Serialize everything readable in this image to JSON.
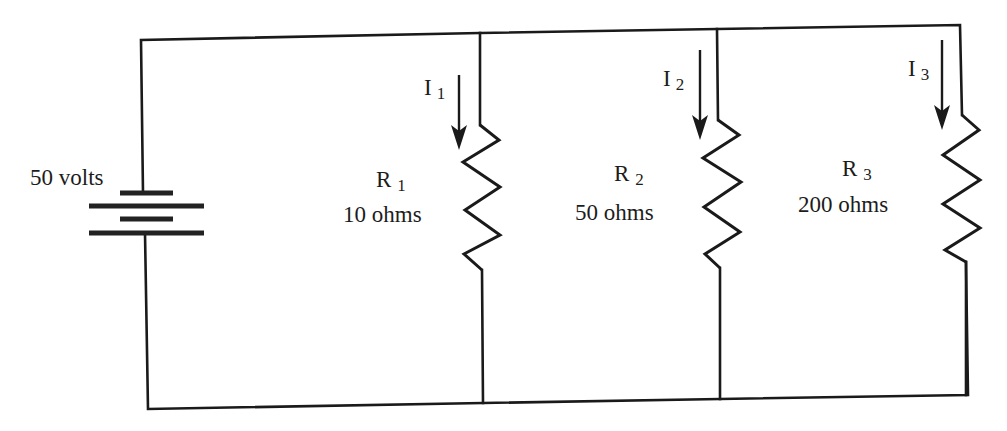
{
  "diagram": {
    "type": "parallel-circuit-schematic",
    "colors": {
      "background": "#ffffff",
      "ink": "#1a1a1a"
    },
    "source": {
      "label": "50 volts",
      "symbol": "battery-icon",
      "voltage_value": 50,
      "voltage_unit": "volts"
    },
    "branches": [
      {
        "resistor_name": "R",
        "resistor_index": "1",
        "resistance_label": "10 ohms",
        "resistance_value": 10,
        "current_name": "I",
        "current_index": "1"
      },
      {
        "resistor_name": "R",
        "resistor_index": "2",
        "resistance_label": "50 ohms",
        "resistance_value": 50,
        "current_name": "I",
        "current_index": "2"
      },
      {
        "resistor_name": "R",
        "resistor_index": "3",
        "resistance_label": "200 ohms",
        "resistance_value": 200,
        "current_name": "I",
        "current_index": "3"
      }
    ]
  }
}
